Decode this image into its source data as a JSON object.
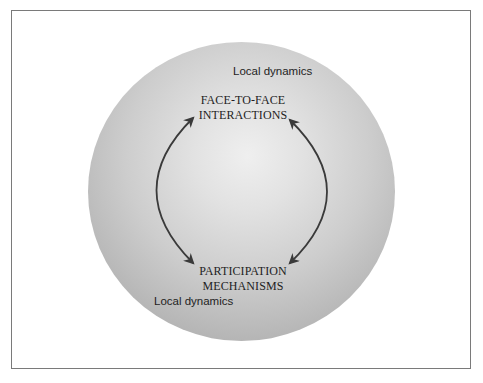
{
  "diagram": {
    "nodes": {
      "top": {
        "line1": "FACE-TO-FACE",
        "line2": "INTERACTIONS"
      },
      "bottom": {
        "line1": "PARTICIPATION",
        "line2": "MECHANISMS"
      }
    },
    "region_labels": {
      "top_right": "Local dynamics",
      "bottom_left": "Local dynamics"
    },
    "relationship": "bidirectional cycle",
    "colors": {
      "frame_border": "#7a7a7a",
      "sphere_center": "#efefef",
      "sphere_edge": "#a2a2a2",
      "arrow": "#3a3a3a",
      "text": "#1e1e1e"
    }
  }
}
